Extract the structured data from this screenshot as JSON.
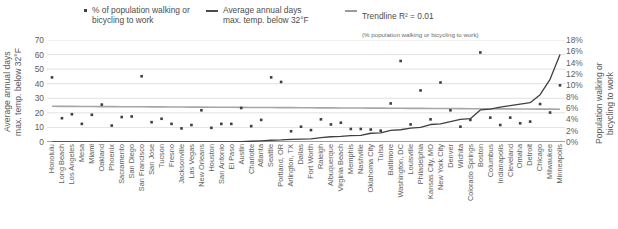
{
  "legend": {
    "scatter": {
      "marker": "square-dot-marker",
      "label": "% of population walking or\nbicycling to work"
    },
    "line": {
      "marker": "line-marker",
      "label": "Average annual days\nmax. temp. below 32°F"
    },
    "trend": {
      "marker": "line-marker",
      "label": "Trendline R² = 0.01",
      "sublabel": "(% population walking or bicycling to work)"
    }
  },
  "axes": {
    "left_title": "Average annual days\nmax. temp. below 32°F",
    "right_title": "Population walking or\nbicycling to work",
    "left_ticks": [
      "70",
      "60",
      "50",
      "40",
      "30",
      "20",
      "10",
      "0"
    ],
    "right_ticks": [
      "18%",
      "16%",
      "14%",
      "12%",
      "10%",
      "8%",
      "6%",
      "4%",
      "2%",
      "0%"
    ]
  },
  "chart_data": {
    "type": "scatter",
    "title": "",
    "xlabel": "",
    "ylabel": "Average annual days max. temp. below 32°F",
    "y2label": "Population walking or bicycling to work",
    "ylim": [
      0,
      70
    ],
    "y2lim": [
      0,
      18
    ],
    "grid": true,
    "legend_position": "top",
    "categories": [
      "Honolulu",
      "Long Beach",
      "Los Angeles",
      "Mesa",
      "Miami",
      "Oakland",
      "Phoenix",
      "Sacramento",
      "San Diego",
      "San Francisco",
      "San Jose",
      "Tucson",
      "Fresno",
      "Jacksonville",
      "Las Vegas",
      "New Orleans",
      "Houston",
      "San Antonio",
      "El Paso",
      "Austin",
      "Charlotte",
      "Atlanta",
      "Seattle",
      "Portland, OR",
      "Arlington, TX",
      "Dallas",
      "Fort Worth",
      "Raleigh",
      "Albuquerque",
      "Virginia Beach",
      "Memphis",
      "Nashville",
      "Oklahoma City",
      "Tulsa",
      "Baltimore",
      "Washington, DC",
      "Louisville",
      "Philadelphia",
      "Kansas City, MO",
      "New York City",
      "Denver",
      "Wichita",
      "Colorado Springs",
      "Boston",
      "Columbus",
      "Indianapolis",
      "Cleveland",
      "Omaha",
      "Detroit",
      "Chicago",
      "Milwaukee",
      "Minneapolis"
    ],
    "series": [
      {
        "name": "% of population walking or bicycling to work",
        "axis": "right",
        "unit": "%",
        "values": [
          11.4,
          4.2,
          4.9,
          3.2,
          4.8,
          6.6,
          2.9,
          4.4,
          4.5,
          11.6,
          3.5,
          4.1,
          3.2,
          2.4,
          3.0,
          5.6,
          2.5,
          3.2,
          3.2,
          6.0,
          2.8,
          3.9,
          11.4,
          10.6,
          1.9,
          2.7,
          2.1,
          4.0,
          3.1,
          3.4,
          2.3,
          2.3,
          2.2,
          2.0,
          6.8,
          14.3,
          3.1,
          9.1,
          4.0,
          10.5,
          5.6,
          2.7,
          3.9,
          15.8,
          4.3,
          3.0,
          4.3,
          3.3,
          3.6,
          6.7,
          5.2,
          10.0
        ]
      },
      {
        "name": "Average annual days max. temp. below 32°F",
        "axis": "left",
        "unit": "days",
        "values": [
          0,
          0,
          0,
          0,
          0,
          0,
          0,
          0,
          0,
          0,
          0,
          0,
          0,
          0,
          0,
          0,
          0,
          0,
          0,
          0.2,
          0.5,
          0.8,
          1.2,
          1.4,
          1.8,
          2.0,
          2.2,
          3.0,
          3.6,
          3.8,
          4.4,
          4.6,
          6.0,
          6.2,
          8.0,
          8.4,
          9.5,
          10.0,
          12.0,
          12.5,
          14.0,
          15.5,
          16.0,
          22.0,
          22.5,
          24.0,
          25.0,
          26.0,
          27.0,
          32.5,
          43.0,
          60.0
        ]
      },
      {
        "name": "Trendline R² = 0.01",
        "axis": "right",
        "unit": "%",
        "type": "line",
        "values": [
          6.3,
          6.29,
          6.28,
          6.27,
          6.26,
          6.25,
          6.24,
          6.23,
          6.22,
          6.21,
          6.2,
          6.19,
          6.18,
          6.17,
          6.16,
          6.15,
          6.14,
          6.13,
          6.12,
          6.11,
          6.1,
          6.09,
          6.08,
          6.07,
          6.06,
          6.05,
          6.04,
          6.03,
          6.02,
          6.01,
          6.0,
          5.99,
          5.98,
          5.97,
          5.96,
          5.95,
          5.94,
          5.93,
          5.92,
          5.91,
          5.9,
          5.89,
          5.88,
          5.87,
          5.86,
          5.85,
          5.84,
          5.83,
          5.82,
          5.81,
          5.8,
          5.79
        ]
      }
    ]
  }
}
